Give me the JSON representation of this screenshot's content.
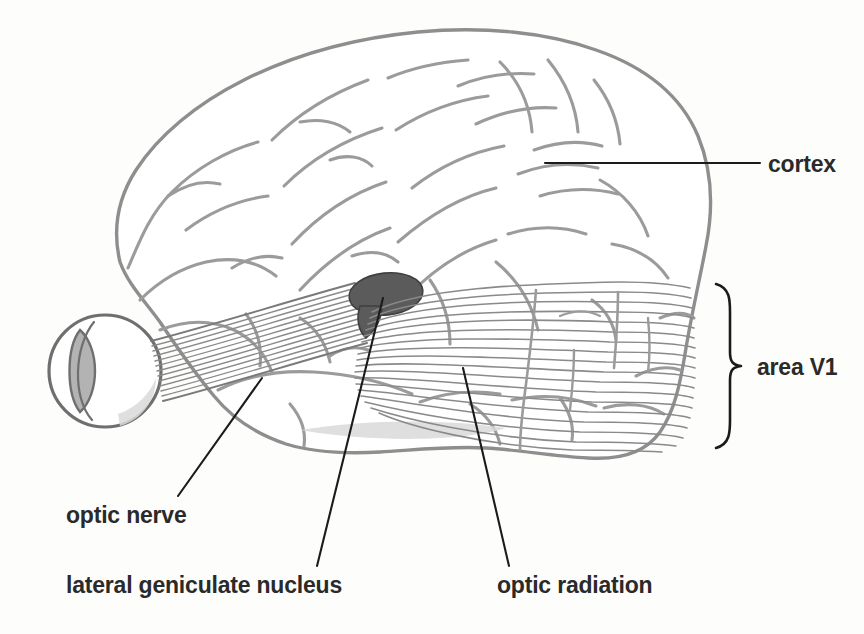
{
  "figure": {
    "background_color": "#fdfdfc",
    "line_color": "#9b9b9b",
    "leader_color": "#1b1b1b",
    "label_color": "#2a2a2a",
    "lgn_color": "#5b5b5b",
    "fiber_color": "#8a8a8a"
  },
  "labels": {
    "cortex": "cortex",
    "area_v1": "area V1",
    "optic_nerve": "optic nerve",
    "lateral_geniculate_nucleus": "lateral geniculate nucleus",
    "optic_radiation": "optic radiation"
  },
  "annotations": [
    {
      "name": "cortex",
      "text": "cortex",
      "x": 768,
      "y": 170,
      "leader": "horizontal",
      "target_x": 545,
      "target_y": 163
    },
    {
      "name": "area-v1",
      "text": "area V1",
      "x": 757,
      "y": 374,
      "leader": "brace",
      "brace_top": 283,
      "brace_bottom": 448
    },
    {
      "name": "optic-nerve",
      "text": "optic nerve",
      "x": 66,
      "y": 522,
      "leader": "diagonal",
      "target_x": 262,
      "target_y": 378
    },
    {
      "name": "lateral-geniculate-nucleus",
      "text": "lateral geniculate nucleus",
      "x": 66,
      "y": 592,
      "leader": "diagonal",
      "target_x": 383,
      "target_y": 298
    },
    {
      "name": "optic-radiation",
      "text": "optic radiation",
      "x": 497,
      "y": 592,
      "leader": "diagonal",
      "target_x": 463,
      "target_y": 368
    }
  ],
  "structures": [
    {
      "name": "eyeball",
      "center_x": 105,
      "center_y": 371,
      "radius": 56
    },
    {
      "name": "lens",
      "center_x": 92,
      "center_y": 371
    },
    {
      "name": "optic-nerve-tract",
      "from_x": 160,
      "from_y": 378,
      "to_x": 360,
      "to_y": 300
    },
    {
      "name": "lateral-geniculate-nucleus-body",
      "center_x": 386,
      "center_y": 294,
      "rx": 36,
      "ry": 21
    },
    {
      "name": "optic-radiation-fibers",
      "count": 18,
      "from_x": 375,
      "to_x": 692
    },
    {
      "name": "cerebral-cortex-outline"
    }
  ]
}
